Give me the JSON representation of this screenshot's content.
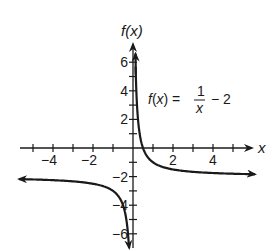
{
  "chart_data": {
    "type": "line",
    "title": "",
    "function": "f(x) = 1/x - 2",
    "annotation": {
      "lhs": "f(x) =",
      "numerator": "1",
      "denominator": "x",
      "rhs": "− 2"
    },
    "xlabel": "x",
    "ylabel": "f(x)",
    "xlim": [
      -5.5,
      6
    ],
    "ylim": [
      -7,
      7
    ],
    "x_ticks": [
      -5,
      -4,
      -3,
      -2,
      -1,
      0,
      1,
      2,
      3,
      4,
      5
    ],
    "x_tick_labels": [
      "−4",
      "−2",
      "2",
      "4"
    ],
    "x_tick_label_values": [
      -4,
      -2,
      2,
      4
    ],
    "y_ticks": [
      -6,
      -5,
      -4,
      -3,
      -2,
      -1,
      0,
      1,
      2,
      3,
      4,
      5,
      6
    ],
    "y_tick_labels": [
      "6",
      "4",
      "2",
      "−2",
      "−4",
      "−6"
    ],
    "y_tick_label_values": [
      6,
      4,
      2,
      -2,
      -4,
      -6
    ],
    "grid": false,
    "legend": null,
    "series": [
      {
        "name": "right branch",
        "x": [
          0.12,
          0.2,
          0.3,
          0.5,
          1,
          2,
          3,
          4,
          5,
          6
        ],
        "y": [
          6.33,
          3,
          1.33,
          0,
          -1,
          -1.5,
          -1.67,
          -1.75,
          -1.8,
          -1.83
        ]
      },
      {
        "name": "left branch",
        "x": [
          -5.6,
          -5,
          -4,
          -3,
          -2,
          -1,
          -0.5,
          -0.3,
          -0.2
        ],
        "y": [
          -2.18,
          -2.2,
          -2.25,
          -2.33,
          -2.5,
          -3,
          -4,
          -5.33,
          -7
        ]
      }
    ],
    "asymptotes": {
      "vertical": 0,
      "horizontal": -2
    }
  }
}
